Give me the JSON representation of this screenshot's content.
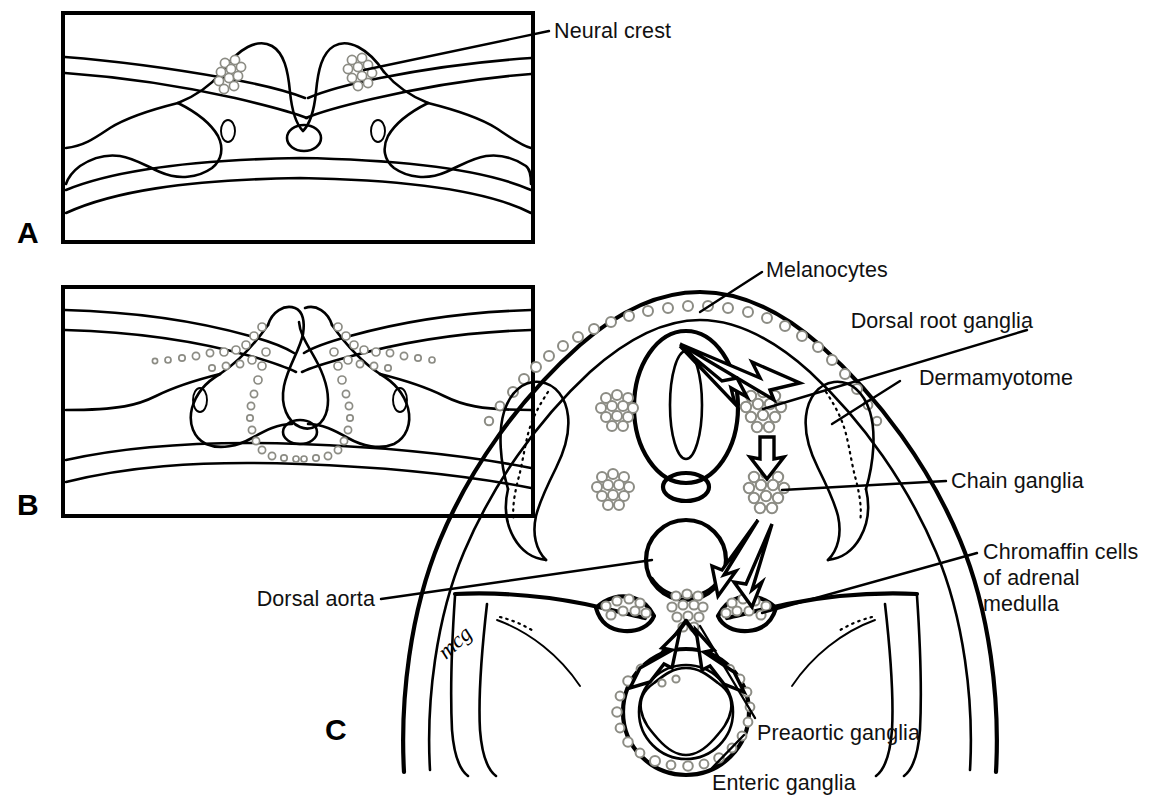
{
  "figure": {
    "background": "#ffffff",
    "ink": "#111111",
    "cell_outline_color": "#8c8c84",
    "width": 1155,
    "height": 807
  },
  "panels": [
    {
      "id": "A",
      "letter": "A",
      "caption": "Neural groove stage with neural crest at the crest tips"
    },
    {
      "id": "B",
      "letter": "B",
      "caption": "Neural tube closing, crest cells migrating ventrally"
    },
    {
      "id": "C",
      "letter": "C",
      "caption": "Embryo cross-section showing neural crest derivatives"
    }
  ],
  "labels": [
    {
      "id": "neural-crest",
      "text": "Neural crest",
      "panel": "A"
    },
    {
      "id": "melanocytes",
      "text": "Melanocytes",
      "panel": "C"
    },
    {
      "id": "dorsal-root-ganglia",
      "text": "Dorsal root ganglia",
      "panel": "C"
    },
    {
      "id": "dermamyotome",
      "text": "Dermamyotome",
      "panel": "C"
    },
    {
      "id": "chain-ganglia",
      "text": "Chain ganglia",
      "panel": "C"
    },
    {
      "id": "chromaffin-cells",
      "text": "Chromaffin cells",
      "panel": "C"
    },
    {
      "id": "of-adrenal",
      "text": "of adrenal",
      "panel": "C"
    },
    {
      "id": "medulla",
      "text": "medulla",
      "panel": "C"
    },
    {
      "id": "dorsal-aorta",
      "text": "Dorsal aorta",
      "panel": "C"
    },
    {
      "id": "preaortic-ganglia",
      "text": "Preaortic ganglia",
      "panel": "C"
    },
    {
      "id": "enteric-ganglia",
      "text": "Enteric ganglia",
      "panel": "C"
    }
  ],
  "signature": {
    "text": "mcg"
  }
}
